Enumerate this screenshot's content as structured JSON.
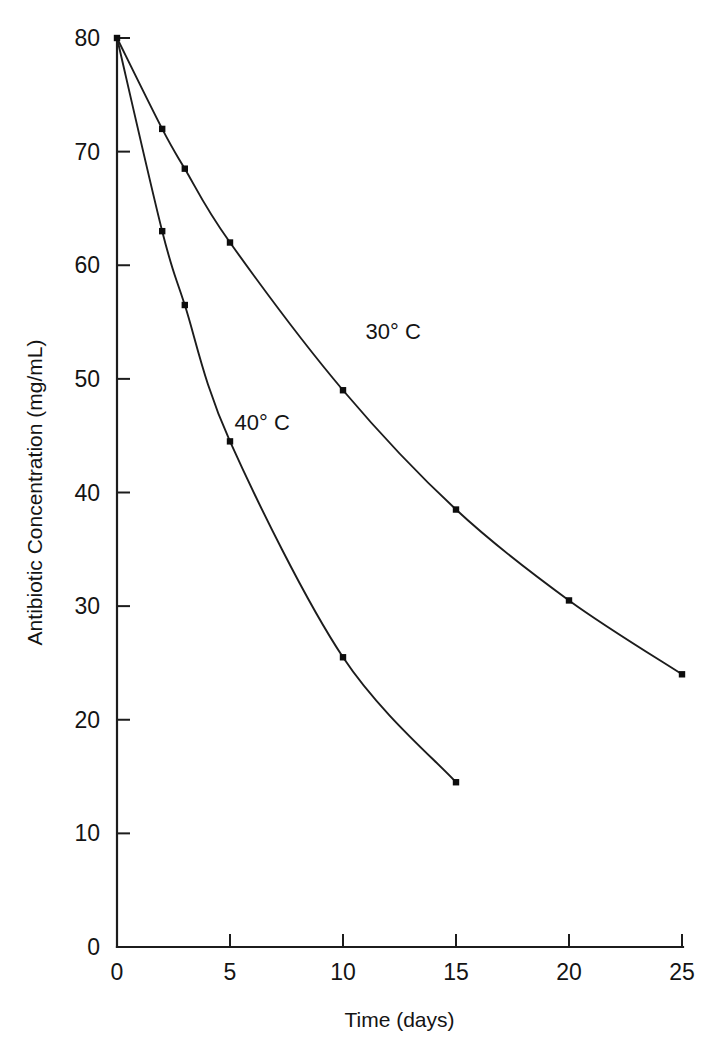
{
  "chart_data": {
    "type": "line",
    "title": "",
    "xlabel": "Time (days)",
    "ylabel": "Antibiotic Concentration (mg/mL)",
    "xlim": [
      0,
      25
    ],
    "ylim": [
      0,
      80
    ],
    "xticks": [
      "0",
      "5",
      "10",
      "15",
      "20",
      "25"
    ],
    "xtick_values": [
      0,
      5,
      10,
      15,
      20,
      25
    ],
    "yticks": [
      "0",
      "10",
      "20",
      "30",
      "40",
      "50",
      "60",
      "70",
      "80"
    ],
    "ytick_values": [
      0,
      10,
      20,
      30,
      40,
      50,
      60,
      70,
      80
    ],
    "grid": false,
    "legend_position": "inline-annotations",
    "series": [
      {
        "name": "30° C",
        "label": "30° C",
        "label_x": 11.0,
        "label_y": 53.5,
        "x": [
          0,
          2,
          3,
          5,
          10,
          15,
          20,
          25
        ],
        "values": [
          80,
          72,
          68.5,
          62,
          49,
          38.5,
          30.5,
          24
        ]
      },
      {
        "name": "40° C",
        "label": "40° C",
        "label_x": 5.2,
        "label_y": 45.5,
        "x": [
          0,
          2,
          3,
          5,
          10,
          15
        ],
        "values": [
          80,
          63,
          56.5,
          44.5,
          25.5,
          14.5
        ]
      }
    ],
    "annotations": [
      {
        "text": "30° C",
        "x": 11.0,
        "y": 53.5
      },
      {
        "text": "40° C",
        "x": 5.2,
        "y": 45.5
      }
    ]
  },
  "axes": {
    "x_title": "Time (days)",
    "y_title": "Antibiotic Concentration (mg/mL)"
  },
  "ticks": {
    "x": [
      "0",
      "5",
      "10",
      "15",
      "20",
      "25"
    ],
    "y": [
      "0",
      "10",
      "20",
      "30",
      "40",
      "50",
      "60",
      "70",
      "80"
    ]
  },
  "labels": {
    "series_30": "30° C",
    "series_40": "40° C"
  }
}
